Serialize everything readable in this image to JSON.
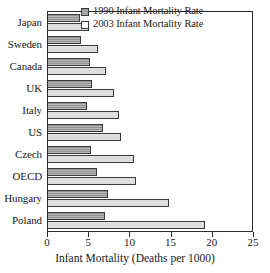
{
  "chart_data": {
    "type": "bar",
    "orientation": "horizontal",
    "title": "",
    "xlabel": "Infant Mortality (Deaths per 1000)",
    "ylabel": "",
    "xlim": [
      0,
      25
    ],
    "xticks": [
      0,
      5,
      10,
      15,
      20,
      25
    ],
    "grid": false,
    "legend_position": "top-right",
    "categories": [
      "Japan",
      "Sweden",
      "Canada",
      "UK",
      "Italy",
      "US",
      "Czech",
      "OECD",
      "Hungary",
      "Poland"
    ],
    "series": [
      {
        "name": "1990 Infant Mortality Rate",
        "color": "#9a9a9a",
        "values": [
          3.9,
          4.0,
          5.1,
          5.4,
          4.8,
          6.8,
          5.3,
          6.0,
          7.4,
          7.0
        ]
      },
      {
        "name": "2003 Infant Mortality Rate",
        "color": "#dedede",
        "values": [
          5.0,
          6.1,
          7.1,
          8.1,
          8.7,
          9.0,
          10.6,
          10.8,
          14.8,
          19.3
        ]
      }
    ]
  },
  "axis": {
    "x_title": "Infant Mortality (Deaths per 1000)",
    "tick_labels": [
      "0",
      "5",
      "10",
      "15",
      "20",
      "25"
    ]
  },
  "legend": {
    "items": [
      {
        "label": "1990 Infant Mortality Rate"
      },
      {
        "label": "2003 Infant Mortality Rate"
      }
    ]
  }
}
